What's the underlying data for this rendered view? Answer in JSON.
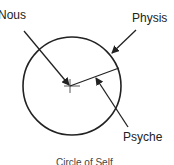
{
  "diagram": {
    "labels": {
      "nous": "Nous",
      "physis": "Physis",
      "psyche": "Psyche"
    },
    "caption": "Circle of Self",
    "colors": {
      "stroke": "#222222",
      "text": "#222222",
      "background": "#ffffff"
    }
  }
}
